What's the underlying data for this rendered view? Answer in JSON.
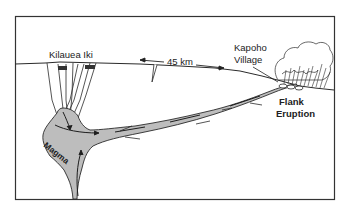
{
  "diagram": {
    "labels": {
      "summit_crater": "Kilauea Iki",
      "distance": "45 km",
      "village_line1": "Kapoho",
      "village_line2": "Village",
      "eruption_line1": "Flank",
      "eruption_line2": "Eruption",
      "magma": "Magma"
    },
    "colors": {
      "frame": "#333333",
      "ink": "#2a2a2a",
      "magma_fill": "#bdbdbd",
      "background": "#ffffff"
    }
  }
}
